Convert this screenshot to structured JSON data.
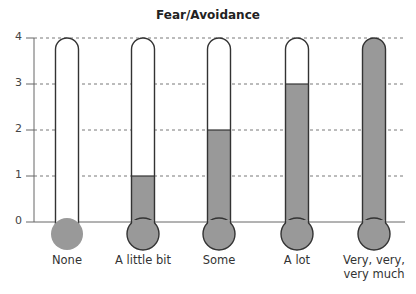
{
  "chart_data": {
    "type": "bar",
    "subtype": "thermometer",
    "title": "Fear/Avoidance",
    "xlabel": "",
    "ylabel": "",
    "categories": [
      "None",
      "A little bit",
      "Some",
      "A lot",
      "Very, very, very much"
    ],
    "category_lines": [
      [
        "None"
      ],
      [
        "A little bit"
      ],
      [
        "Some"
      ],
      [
        "A lot"
      ],
      [
        "Very, very,",
        "very much"
      ]
    ],
    "values": [
      0,
      1,
      2,
      3,
      4
    ],
    "ylim": [
      0,
      4
    ],
    "yticks": [
      0,
      1,
      2,
      3,
      4
    ],
    "grid": "dashed horizontal at each y tick",
    "legend": null
  },
  "colors": {
    "fill": "#999999",
    "outline": "#333333",
    "grid": "#555555",
    "background": "#ffffff"
  }
}
